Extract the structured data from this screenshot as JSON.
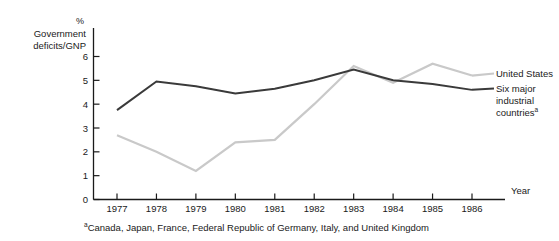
{
  "chart_data": {
    "type": "line",
    "title": "",
    "xlabel": "Year",
    "ylabel": "Government deficits/GNP",
    "yunit": "%",
    "x": [
      1977,
      1978,
      1979,
      1980,
      1981,
      1982,
      1983,
      1984,
      1985,
      1986
    ],
    "categories": [
      "1977",
      "1978",
      "1979",
      "1980",
      "1981",
      "1982",
      "1983",
      "1984",
      "1985",
      "1986"
    ],
    "xlim": [
      1976.3,
      1986.6
    ],
    "ylim": [
      0,
      6.6
    ],
    "yticks": [
      0,
      1,
      2,
      3,
      4,
      5,
      6
    ],
    "ytick_labels": [
      "0",
      "1",
      "2",
      "3",
      "4",
      "5",
      "6"
    ],
    "grid": false,
    "legend_position": "right",
    "series": [
      {
        "name": "United States",
        "color": "#c9c9c9",
        "values": [
          2.7,
          2.0,
          1.2,
          2.4,
          2.5,
          4.0,
          5.6,
          4.9,
          5.7,
          5.2
        ]
      },
      {
        "name": "Six major industrial countries",
        "color": "#3a3a3a",
        "values": [
          3.75,
          4.95,
          4.75,
          4.45,
          4.65,
          5.0,
          5.45,
          5.0,
          4.85,
          4.6
        ]
      }
    ],
    "footnote_marker": "a",
    "footnote": "Canada, Japan, France, Federal Republic of Germany, Italy, and United Kingdom",
    "legend": [
      {
        "label": "United States",
        "marker": "",
        "color": "#c9c9c9"
      },
      {
        "label_line1": "Six major",
        "label_line2": "industrial",
        "label_line3": "countries",
        "marker": "a",
        "color": "#3a3a3a"
      }
    ]
  },
  "axis": {
    "ylabel_line1": "Government",
    "ylabel_line2": "deficits/GNP",
    "unit": "%",
    "xaxis_label": "Year"
  },
  "legend": {
    "us_label": "United States",
    "six_line1": "Six major",
    "six_line2": "industrial",
    "six_line3": "countries",
    "six_sup": "a"
  },
  "footnote": {
    "marker": "a",
    "text": "Canada, Japan, France, Federal Republic of Germany, Italy, and United Kingdom"
  },
  "ticks": {
    "y": [
      "0",
      "1",
      "2",
      "3",
      "4",
      "5",
      "6"
    ],
    "x": [
      "1977",
      "1978",
      "1979",
      "1980",
      "1981",
      "1982",
      "1983",
      "1984",
      "1985",
      "1986"
    ]
  }
}
